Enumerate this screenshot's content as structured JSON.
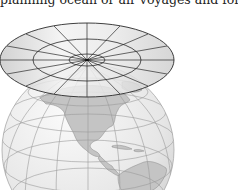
{
  "caption": {
    "text": "planning ocean or air voyages and for ai"
  },
  "figure": {
    "colors": {
      "globe_fill": "#ececec",
      "land_fill": "#c4c4c4",
      "grid_line": "#9a9a9a",
      "plane_fill": "#dcdcdc",
      "plane_line": "#2a2a2a",
      "background": "#ffffff"
    },
    "plane": {
      "center": [
        87,
        60
      ],
      "rings_rx_ry": [
        [
          18,
          6
        ],
        [
          54,
          21
        ],
        [
          87,
          37
        ]
      ],
      "spokes": 16
    },
    "globe": {
      "center": [
        88,
        150
      ],
      "radius": 86
    },
    "regions_shown": [
      "North America",
      "Central America",
      "Caribbean",
      "South America (north)"
    ]
  }
}
